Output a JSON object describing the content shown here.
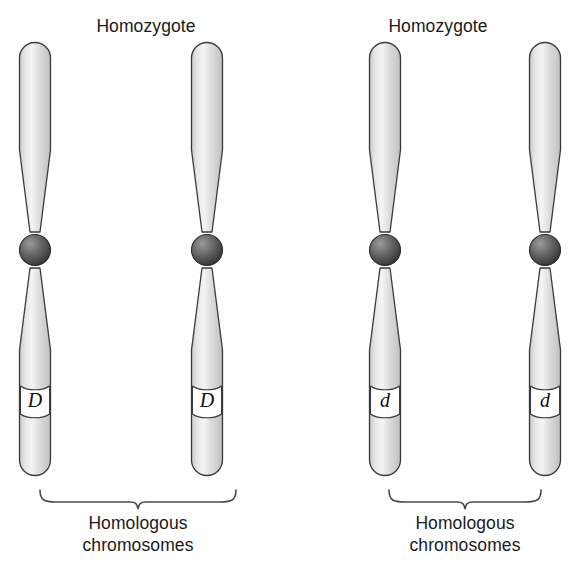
{
  "diagram": {
    "title_left": "Homozygote",
    "title_right": "Homozygote",
    "caption_left_line1": "Homologous",
    "caption_left_line2": "chromosomes",
    "caption_right_line1": "Homologous",
    "caption_right_line2": "chromosomes",
    "colors": {
      "chromosome_fill_light": "#f2f2f2",
      "chromosome_fill_mid": "#d6d6d6",
      "chromosome_fill_dark": "#c2c2c2",
      "chromosome_outline": "#3a3a3a",
      "centromere_light": "#8e8e8e",
      "centromere_dark": "#3c3c3c",
      "band_fill": "#ffffff",
      "text": "#1a1a1a",
      "brace": "#4a4a4a",
      "background": "#ffffff"
    },
    "pairs": [
      {
        "name": "left-pair",
        "genotype": "DD",
        "chromosomes": [
          {
            "name": "chromosome-1",
            "allele": "D"
          },
          {
            "name": "chromosome-2",
            "allele": "D"
          }
        ]
      },
      {
        "name": "right-pair",
        "genotype": "dd",
        "chromosomes": [
          {
            "name": "chromosome-3",
            "allele": "d"
          },
          {
            "name": "chromosome-4",
            "allele": "d"
          }
        ]
      }
    ]
  }
}
